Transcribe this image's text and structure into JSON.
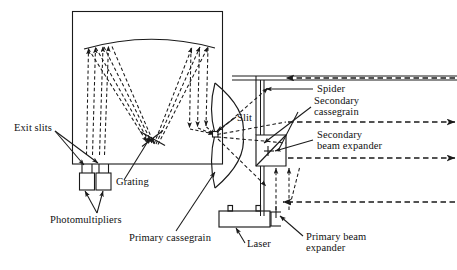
{
  "figure": {
    "kind": "optical-system-schematic",
    "stroke_color": "#1a1a1a",
    "ray_color": "#2b2b2b",
    "background": "#ffffff"
  },
  "labels": {
    "exit_slits": "Exit slits",
    "photomultipliers": "Photomultipliers",
    "grating": "Grating",
    "primary_cassegrain": "Primary cassegrain",
    "slit": "Slit",
    "laser": "Laser",
    "spider": "Spider",
    "secondary_cassegrain_line1": "Secondary",
    "secondary_cassegrain_line2": "cassegrain",
    "secondary_beam_expander_line1": "Secondary",
    "secondary_beam_expander_line2": "beam expander",
    "primary_beam_expander_line1": "Primary beam",
    "primary_beam_expander_line2": "expander"
  },
  "components": [
    {
      "name": "spectrometer-housing",
      "shape": "rectangle"
    },
    {
      "name": "collimating-mirror",
      "shape": "concave-arc"
    },
    {
      "name": "diffraction-grating",
      "shape": "tilted-line"
    },
    {
      "name": "photomultiplier-tube-1",
      "shape": "square"
    },
    {
      "name": "photomultiplier-tube-2",
      "shape": "square"
    },
    {
      "name": "primary-cassegrain-mirror",
      "shape": "lens-curve"
    },
    {
      "name": "secondary-cassegrain-mirror",
      "shape": "trapezoid"
    },
    {
      "name": "spider-support",
      "shape": "vertical-strut"
    },
    {
      "name": "laser-head",
      "shape": "rectangle"
    },
    {
      "name": "primary-beam-expander",
      "shape": "inline-optic"
    },
    {
      "name": "secondary-beam-expander",
      "shape": "inline-optic"
    }
  ],
  "beams": [
    {
      "name": "beam-top-incoming",
      "y": 78,
      "direction": "left"
    },
    {
      "name": "beam-middle-outgoing",
      "y": 122,
      "direction": "right"
    },
    {
      "name": "beam-lower-outgoing",
      "y": 158,
      "direction": "right"
    },
    {
      "name": "beam-bottom-incoming",
      "y": 202,
      "direction": "left"
    }
  ]
}
